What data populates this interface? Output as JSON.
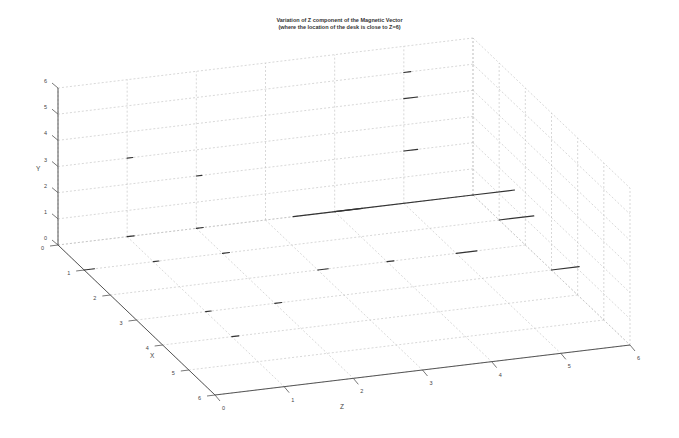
{
  "chart_data": {
    "type": "scatter3d",
    "title": "Variation of Z component of the Magnetic Vector",
    "subtitle": "(where the location of the desk is close to Z=6)",
    "xlabel": "X",
    "ylabel": "Y",
    "zlabel": "Z",
    "xlim": [
      0,
      6
    ],
    "ylim": [
      0,
      6
    ],
    "zlim": [
      0,
      6
    ],
    "x_ticks": [
      "0",
      "1",
      "2",
      "3",
      "4",
      "5",
      "6"
    ],
    "y_ticks": [
      "0",
      "1",
      "2",
      "3",
      "4",
      "5",
      "6"
    ],
    "z_ticks": [
      "0",
      "1",
      "2",
      "3",
      "4",
      "5",
      "6"
    ],
    "grid": true,
    "points": [
      {
        "x": 0,
        "y": 0,
        "z": 6,
        "len": 0.6
      },
      {
        "x": 1,
        "y": 0,
        "z": 6,
        "len": 0.5
      },
      {
        "x": 3,
        "y": 0,
        "z": 6,
        "len": 0.4
      },
      {
        "x": 0,
        "y": 0,
        "z": 4,
        "len": 2.0
      },
      {
        "x": 0,
        "y": 0,
        "z": 3.4,
        "len": 1.0
      },
      {
        "x": 0,
        "y": 0,
        "z": 1,
        "len": 0.1
      },
      {
        "x": 0,
        "y": 0,
        "z": 2,
        "len": 0.1
      },
      {
        "x": 1,
        "y": 0,
        "z": 0,
        "len": 0.15
      },
      {
        "x": 1,
        "y": 0,
        "z": 1,
        "len": 0.05
      },
      {
        "x": 1,
        "y": 0,
        "z": 2,
        "len": 0.1
      },
      {
        "x": 2,
        "y": 0,
        "z": 3,
        "len": 0.15
      },
      {
        "x": 2,
        "y": 0,
        "z": 4,
        "len": 0.1
      },
      {
        "x": 3,
        "y": 0,
        "z": 1,
        "len": 0.05
      },
      {
        "x": 3,
        "y": 0,
        "z": 2,
        "len": 0.1
      },
      {
        "x": 4,
        "y": 0,
        "z": 1,
        "len": 0.1
      },
      {
        "x": 2,
        "y": 0,
        "z": 5,
        "len": 0.3
      },
      {
        "x": 0,
        "y": 3,
        "z": 1,
        "len": 0.05
      },
      {
        "x": 0,
        "y": 2,
        "z": 2,
        "len": 0.05
      },
      {
        "x": 0,
        "y": 4,
        "z": 5,
        "len": 0.2
      },
      {
        "x": 0,
        "y": 2,
        "z": 5,
        "len": 0.2
      },
      {
        "x": 0,
        "y": 5,
        "z": 5,
        "len": 0.1
      }
    ]
  }
}
